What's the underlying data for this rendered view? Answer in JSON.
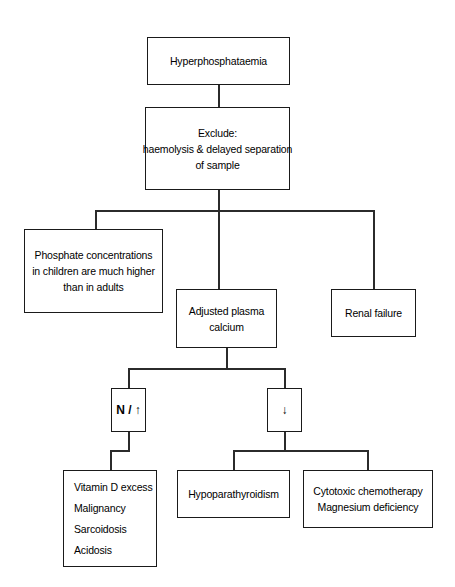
{
  "diagram": {
    "background_color": "#ffffff",
    "line_color": "#2b2b2b",
    "box_border_color": "#1a1a1a",
    "text_color": "#000000"
  },
  "nodes": {
    "root": {
      "lines": [
        "Hyperphosphataemia"
      ]
    },
    "exclude": {
      "lines": [
        "Exclude:",
        "haemolysis & delayed separation",
        "of sample"
      ]
    },
    "paediatric_note": {
      "lines": [
        "Phosphate concentrations",
        "in children are much higher",
        "than in adults"
      ]
    },
    "adjusted_calcium": {
      "lines": [
        "Adjusted plasma",
        "calcium"
      ]
    },
    "renal_failure": {
      "lines": [
        "Renal failure"
      ]
    },
    "calcium_normal_high": {
      "lines": [
        "N / ↑"
      ]
    },
    "calcium_low": {
      "lines": [
        "↓"
      ]
    },
    "high_calcium_causes": {
      "lines": [
        "Vitamin D excess",
        "Malignancy",
        "Sarcoidosis",
        "Acidosis"
      ]
    },
    "hypoparathyroidism": {
      "lines": [
        "Hypoparathyroidism"
      ]
    },
    "other_low_calcium_causes": {
      "lines": [
        "Cytotoxic chemotherapy",
        "Magnesium deficiency"
      ]
    }
  }
}
